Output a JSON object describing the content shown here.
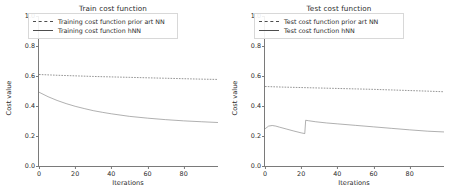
{
  "chart_data": [
    {
      "type": "line",
      "title": "Train cost function",
      "xlabel": "Iterations",
      "ylabel": "Cost value",
      "xlim": [
        0,
        99
      ],
      "ylim": [
        0.0,
        1.0
      ],
      "xticks": [
        0,
        20,
        40,
        60,
        80
      ],
      "yticks": [
        "0.0",
        "0.2",
        "0.4",
        "0.6",
        "0.8",
        "1.0"
      ],
      "grid": false,
      "legend_position": "upper center",
      "series": [
        {
          "name": "Training cost function prior art NN",
          "style": "dashed",
          "color": "#4d4d4d",
          "x": [
            0,
            10,
            20,
            30,
            40,
            50,
            60,
            70,
            80,
            90,
            99
          ],
          "values": [
            0.61,
            0.605,
            0.601,
            0.597,
            0.594,
            0.591,
            0.588,
            0.585,
            0.582,
            0.579,
            0.577
          ]
        },
        {
          "name": "Training cost function hNN",
          "style": "solid",
          "color": "#7a7a7a",
          "x": [
            0,
            5,
            10,
            15,
            20,
            25,
            30,
            35,
            40,
            50,
            60,
            70,
            80,
            90,
            99
          ],
          "values": [
            0.492,
            0.462,
            0.437,
            0.416,
            0.398,
            0.383,
            0.369,
            0.358,
            0.348,
            0.331,
            0.319,
            0.309,
            0.301,
            0.295,
            0.29
          ]
        }
      ]
    },
    {
      "type": "line",
      "title": "Test cost function",
      "xlabel": "Iterations",
      "ylabel": "Cost value",
      "xlim": [
        0,
        99
      ],
      "ylim": [
        0.0,
        1.0
      ],
      "xticks": [
        0,
        20,
        40,
        60,
        80
      ],
      "yticks": [
        "0.0",
        "0.2",
        "0.4",
        "0.6",
        "0.8",
        "1.0"
      ],
      "grid": false,
      "legend_position": "upper center",
      "series": [
        {
          "name": "Test cost function prior art NN",
          "style": "dashed",
          "color": "#4d4d4d",
          "x": [
            0,
            10,
            20,
            30,
            40,
            50,
            60,
            70,
            80,
            90,
            99
          ],
          "values": [
            0.53,
            0.526,
            0.523,
            0.52,
            0.517,
            0.514,
            0.511,
            0.507,
            0.503,
            0.499,
            0.495
          ]
        },
        {
          "name": "Test cost function hNN",
          "style": "solid",
          "color": "#7a7a7a",
          "x": [
            0,
            2,
            4,
            6,
            8,
            12,
            16,
            20,
            22,
            22.5,
            24,
            28,
            34,
            40,
            50,
            60,
            70,
            80,
            90,
            99
          ],
          "values": [
            0.248,
            0.266,
            0.27,
            0.266,
            0.259,
            0.246,
            0.233,
            0.221,
            0.216,
            0.305,
            0.302,
            0.295,
            0.287,
            0.281,
            0.271,
            0.261,
            0.251,
            0.241,
            0.232,
            0.227
          ]
        }
      ]
    }
  ],
  "panels": [
    {
      "title": "Train cost function",
      "xlabel": "Iterations",
      "ylabel": "Cost value",
      "legend": [
        "Training cost function prior art NN",
        "Training cost function hNN"
      ],
      "yticks": [
        "0.0",
        "0.2",
        "0.4",
        "0.6",
        "0.8",
        "1.0"
      ],
      "xticks": [
        "0",
        "20",
        "40",
        "60",
        "80"
      ]
    },
    {
      "title": "Test cost function",
      "xlabel": "Iterations",
      "ylabel": "Cost value",
      "legend": [
        "Test cost function prior art NN",
        "Test cost function hNN"
      ],
      "yticks": [
        "0.0",
        "0.2",
        "0.4",
        "0.6",
        "0.8",
        "1.0"
      ],
      "xticks": [
        "0",
        "20",
        "40",
        "60",
        "80"
      ]
    }
  ]
}
